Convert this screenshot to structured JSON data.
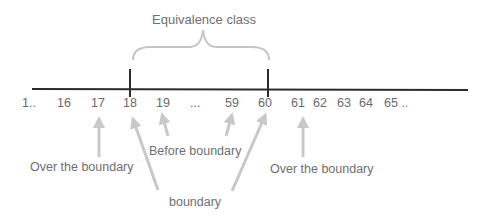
{
  "diagram": {
    "title": "Equivalence class",
    "numbers": [
      {
        "text": "1..",
        "x": 22
      },
      {
        "text": "16",
        "x": 57
      },
      {
        "text": "17",
        "x": 91
      },
      {
        "text": "18",
        "x": 123
      },
      {
        "text": "19",
        "x": 156
      },
      {
        "text": "...",
        "x": 190
      },
      {
        "text": "59",
        "x": 225
      },
      {
        "text": "60",
        "x": 258
      },
      {
        "text": "61",
        "x": 291
      },
      {
        "text": "62",
        "x": 313
      },
      {
        "text": "63",
        "x": 337
      },
      {
        "text": "64",
        "x": 359
      },
      {
        "text": "65 ..",
        "x": 384
      }
    ],
    "labels": {
      "over_left": "Over the boundary",
      "before": "Before boundary",
      "boundary": "boundary",
      "over_right": "Over the boundary"
    },
    "colors": {
      "line": "#2b2b2b",
      "arrow": "#c8c8c8",
      "brace": "#c4c4c4",
      "text": "#6f6f6f"
    }
  }
}
